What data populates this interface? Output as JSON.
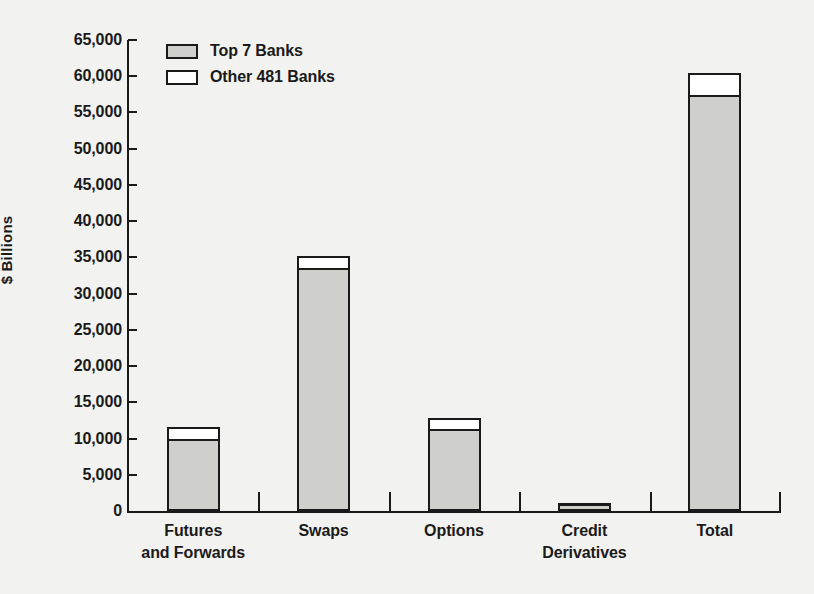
{
  "chart_data": {
    "type": "bar",
    "subtype": "stacked-vertical",
    "title": "",
    "xlabel": "",
    "ylabel": "$ Billions",
    "ylim": [
      0,
      65000
    ],
    "ytick_step": 5000,
    "grid": false,
    "legend_position": "top-left",
    "categories": [
      "Futures and Forwards",
      "Swaps",
      "Options",
      "Credit Derivatives",
      "Total"
    ],
    "category_lines": [
      [
        "Futures",
        "and Forwards"
      ],
      [
        "Swaps",
        ""
      ],
      [
        "Options",
        ""
      ],
      [
        "Credit",
        "Derivatives"
      ],
      [
        "Total",
        ""
      ]
    ],
    "ytick_labels": [
      "65,000",
      "60,000",
      "55,000",
      "50,000",
      "45,000",
      "40,000",
      "35,000",
      "30,000",
      "25,000",
      "20,000",
      "15,000",
      "10,000",
      "5,000",
      "0"
    ],
    "ytick_values": [
      65000,
      60000,
      55000,
      50000,
      45000,
      40000,
      35000,
      30000,
      25000,
      20000,
      15000,
      10000,
      5000,
      0
    ],
    "series": [
      {
        "name": "Top 7 Banks",
        "color": "#cfcfcc",
        "values": [
          9900,
          33600,
          11300,
          900,
          57400
        ]
      },
      {
        "name": "Other 481 Banks",
        "color": "#ffffff",
        "values": [
          1650,
          1650,
          1500,
          200,
          3050
        ]
      }
    ],
    "totals": [
      11550,
      35250,
      12800,
      1100,
      60450
    ]
  },
  "legend": {
    "items": [
      {
        "label": "Top 7 Banks",
        "swatch": "filled"
      },
      {
        "label": "Other 481 Banks",
        "swatch": "hollow"
      }
    ]
  },
  "colors": {
    "background": "#f2f2f0",
    "ink": "#1a1a1a",
    "top7": "#cfcfcc",
    "other": "#ffffff"
  }
}
